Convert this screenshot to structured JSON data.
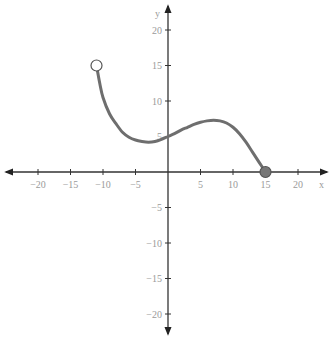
{
  "chart_data": {
    "type": "line",
    "title": "",
    "xlabel": "x",
    "ylabel": "y",
    "xlim": [
      -25,
      25
    ],
    "ylim": [
      -23,
      22
    ],
    "x_ticks": [
      -20,
      -15,
      -10,
      -5,
      5,
      10,
      15,
      20
    ],
    "y_ticks": [
      20,
      15,
      10,
      5,
      -5,
      -10,
      -15,
      -20
    ],
    "x_tick_labels": [
      "−20",
      "−15",
      "−10",
      "−5",
      "5",
      "10",
      "15",
      "20"
    ],
    "y_tick_labels": [
      "20",
      "15",
      "10",
      "5",
      "−5",
      "−10",
      "−15",
      "−20"
    ],
    "grid": false,
    "series": [
      {
        "name": "f(x)",
        "x": [
          -11,
          -10.5,
          -10,
          -9,
          -8,
          -7,
          -6,
          -5,
          -4,
          -3,
          -2,
          -1,
          0,
          1,
          2,
          3,
          4,
          5,
          6,
          7,
          8,
          9,
          10,
          11,
          12,
          13,
          14,
          15
        ],
        "y": [
          15,
          12.5,
          10.5,
          8.2,
          6.8,
          5.6,
          4.9,
          4.5,
          4.3,
          4.2,
          4.3,
          4.6,
          5,
          5.4,
          5.9,
          6.3,
          6.7,
          7,
          7.2,
          7.3,
          7.2,
          6.9,
          6.3,
          5.4,
          4.2,
          2.8,
          1.4,
          0
        ]
      }
    ],
    "endpoints": [
      {
        "x": -11,
        "y": 15,
        "type": "open"
      },
      {
        "x": 15,
        "y": 0,
        "type": "closed"
      }
    ],
    "colors": {
      "curve": "#6e6e6e",
      "axis": "#333333",
      "labels": "#9a9a9a",
      "closed_point": "#777777"
    }
  }
}
